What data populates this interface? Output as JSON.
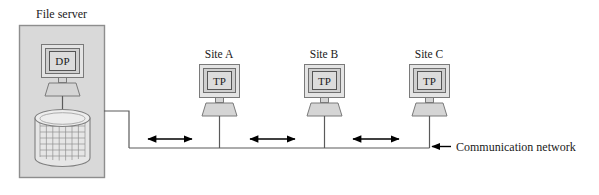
{
  "diagram": {
    "title_label": "File server",
    "network_label": "Communication network",
    "server": {
      "processor_label": "DP",
      "box_fill": "#d9d9d9",
      "box_stroke": "#8a8a8a"
    },
    "sites": [
      {
        "label": "Site A",
        "terminal_label": "TP"
      },
      {
        "label": "Site B",
        "terminal_label": "TP"
      },
      {
        "label": "Site C",
        "terminal_label": "TP"
      }
    ],
    "links": [
      {
        "name": "server-to-site-a",
        "bidirectional": true
      },
      {
        "name": "site-a-to-site-b",
        "bidirectional": true
      },
      {
        "name": "site-b-to-site-c",
        "bidirectional": true
      }
    ],
    "colors": {
      "line": "#555555",
      "arrow": "#000000",
      "screen_fill": "#d0d0d0",
      "bezel_fill": "#e2e2e2",
      "base_fill": "#d5d5d5",
      "disk_fill": "#e6e6e6",
      "text": "#1a1a1a"
    }
  }
}
